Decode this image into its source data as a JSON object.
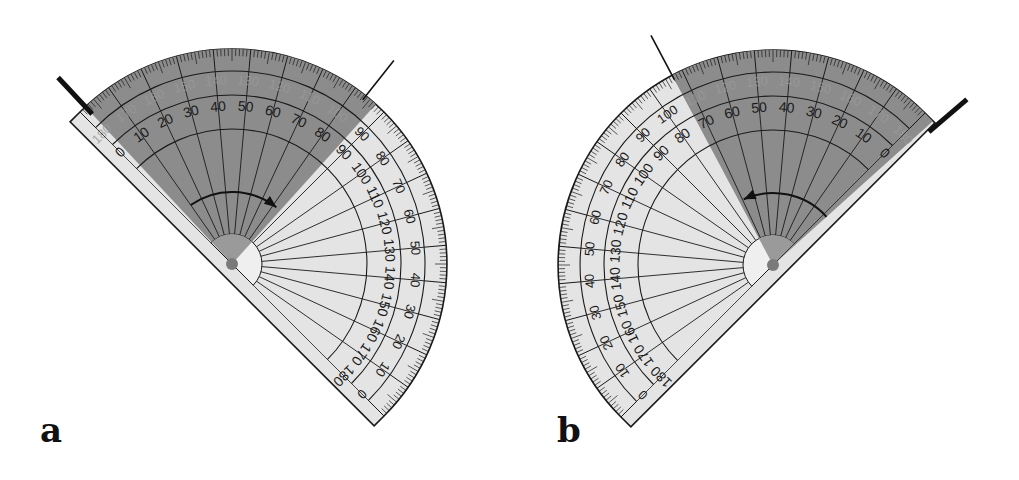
{
  "figure": {
    "panels": [
      {
        "id": "a",
        "label": "a",
        "label_pos": [
          40,
          444
        ],
        "center": [
          232,
          264
        ],
        "radius": 215,
        "orientation": "baseline-nw-se",
        "base_angle_deg": -45,
        "sweep": "ccw",
        "inner_scale_labels": [
          "0",
          "10",
          "20",
          "30",
          "40",
          "50",
          "60",
          "70",
          "80",
          "90",
          "100",
          "110",
          "120",
          "130",
          "140",
          "150",
          "160",
          "170",
          "180"
        ],
        "outer_scale_labels": [
          "180",
          "170",
          "160",
          "150",
          "140",
          "130",
          "120",
          "110",
          "100",
          "90",
          "80",
          "70",
          "60",
          "50",
          "40",
          "30",
          "20",
          "10",
          "0"
        ],
        "shaded_from_deg": 48,
        "shaded_to_deg": 133,
        "arm_thick_deg": 133,
        "arm_thin_deg": 51.5,
        "arrow_direction": "clockwise",
        "measured_reading": "80"
      },
      {
        "id": "b",
        "label": "b",
        "label_pos": [
          557,
          444
        ],
        "center": [
          773,
          265
        ],
        "radius": 215,
        "orientation": "baseline-ne-sw",
        "base_angle_deg": 225,
        "sweep": "cw",
        "inner_scale_labels": [
          "0",
          "10",
          "20",
          "30",
          "40",
          "50",
          "60",
          "70",
          "80",
          "90",
          "100",
          "110",
          "120",
          "130",
          "140",
          "150",
          "160",
          "170",
          "180"
        ],
        "outer_scale_labels": [
          "180",
          "170",
          "160",
          "150",
          "140",
          "130",
          "120",
          "110",
          "100",
          "90",
          "80",
          "70",
          "60",
          "50",
          "40",
          "30",
          "20",
          "10",
          "0"
        ],
        "shaded_from_deg": 42,
        "shaded_to_deg": 118,
        "arm_thick_deg": 40.5,
        "arm_thin_deg": 118,
        "arrow_direction": "counterclockwise",
        "measured_reading": "80"
      }
    ],
    "colors": {
      "plastic": "#e4e4e4",
      "shaded": "#8c8c8c",
      "ink": "#1a1a1a",
      "faint_label": "#9a9a9a",
      "pivot": "#7a7a7a"
    }
  }
}
